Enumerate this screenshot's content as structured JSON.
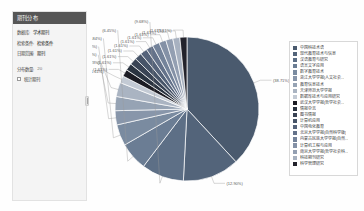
{
  "panel": {
    "title": "期刊分布",
    "fields": [
      {
        "label": "数据库:",
        "value": "学术期刊"
      },
      {
        "label": "检索条件:",
        "value": "检索条件"
      },
      {
        "label": "日期范围:",
        "value": "期刊"
      }
    ],
    "count_label": "分布数量:",
    "count_value": "20",
    "checkbox_label": "统计期刊"
  },
  "legend": {
    "items": [
      {
        "label": "中国科技术语",
        "color": "#4a5a6e"
      },
      {
        "label": "现代教育技术与信息",
        "color": "#53647a"
      },
      {
        "label": "汉语教育与研究",
        "color": "#5d6f86"
      },
      {
        "label": "语言文字应用",
        "color": "#6b7d94"
      },
      {
        "label": "数字教育技术",
        "color": "#7a8ba0"
      },
      {
        "label": "浙江大学学报(人文社会...",
        "color": "#8896aa"
      },
      {
        "label": "教育信息技术",
        "color": "#96a3b4"
      },
      {
        "label": "天津师范大学学报",
        "color": "#aab4c2"
      },
      {
        "label": "数据库技术与应用研究",
        "color": "#c3cad4"
      },
      {
        "label": "武汉大学学报(哲学社会...",
        "color": "#1c1c24"
      },
      {
        "label": "情报杂志",
        "color": "#2a3340"
      },
      {
        "label": "图书情报",
        "color": "#394354"
      },
      {
        "label": "计算机应用",
        "color": "#475468"
      },
      {
        "label": "中国电化教育",
        "color": "#55637a"
      },
      {
        "label": "北京大学学报(自然科学版)",
        "color": "#64728a"
      },
      {
        "label": "内蒙古民族大学学报(自然...",
        "color": "#74839a"
      },
      {
        "label": "计算机工程与应用",
        "color": "#8491a6"
      },
      {
        "label": "南京大学学报(哲学社会科...",
        "color": "#939fb2"
      },
      {
        "label": "科技期刊研究",
        "color": "#a7b1c0"
      },
      {
        "label": "科学管理研究",
        "color": "#23232c"
      }
    ]
  },
  "chart_data": {
    "type": "pie",
    "title": "",
    "legend_position": "right",
    "labels": [
      "中国科技术语",
      "现代教育技术与信息",
      "汉语教育与研究",
      "语言文字应用",
      "数字教育技术",
      "浙江大学学报(人文社会...",
      "教育信息技术",
      "天津师范大学学报",
      "数据库技术与应用研究",
      "武汉大学学报(哲学社会...",
      "情报杂志",
      "图书情报",
      "计算机应用",
      "中国电化教育",
      "北京大学学报(自然科学版)",
      "内蒙古民族大学学报(自然...",
      "计算机工程与应用",
      "南京大学学报(哲学社会科...",
      "科技期刊研究",
      "科学管理研究"
    ],
    "values": [
      38.71,
      12.9,
      9.68,
      6.45,
      4.84,
      3.23,
      3.23,
      3.23,
      1.61,
      1.61,
      1.61,
      1.61,
      1.61,
      1.61,
      1.61,
      1.61,
      1.61,
      1.61,
      1.61,
      1.61
    ],
    "value_labels": [
      "(38.71%)",
      "(12.90%)",
      "(9.68%)",
      "(6.45%)",
      "(4.84%)",
      "(3.23%)",
      "(3.23%)",
      "(3.23%)",
      "(1.61%)",
      "(1.61%)",
      "(1.61%)",
      "(1.61%)",
      "(1.61%)",
      "(1.61%)",
      "(1.61%)",
      "(1.61%)",
      "(1.61%)",
      "(1.61%)",
      "(1.61%)",
      "(1.61%)"
    ],
    "colors": [
      "#4a5a6e",
      "#53647a",
      "#5d6f86",
      "#6b7d94",
      "#7a8ba0",
      "#8896aa",
      "#96a3b4",
      "#aab4c2",
      "#c3cad4",
      "#1c1c24",
      "#2a3340",
      "#394354",
      "#475468",
      "#55637a",
      "#64728a",
      "#74839a",
      "#8491a6",
      "#939fb2",
      "#a7b1c0",
      "#23232c"
    ]
  }
}
